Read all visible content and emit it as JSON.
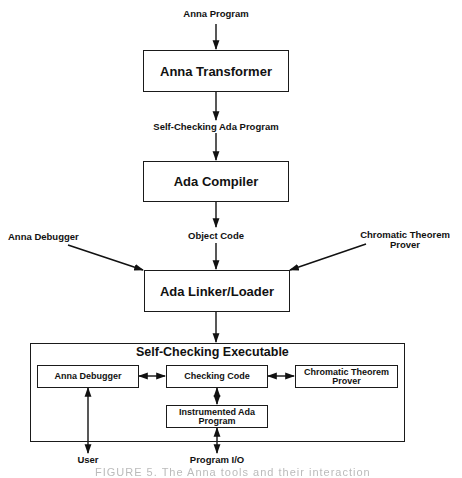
{
  "diagram": {
    "inputs": {
      "anna_program": "Anna Program",
      "self_checking_ada_program": "Self-Checking Ada Program",
      "object_code": "Object Code",
      "anna_debugger": "Anna Debugger",
      "chromatic_theorem_prover": [
        "Chromatic Theorem",
        "Prover"
      ]
    },
    "boxes": {
      "anna_transformer": "Anna Transformer",
      "ada_compiler": "Ada Compiler",
      "ada_linker_loader": "Ada Linker/Loader"
    },
    "executable": {
      "title": "Self-Checking Executable",
      "anna_debugger": "Anna Debugger",
      "checking_code": "Checking Code",
      "chromatic_theorem_prover": [
        "Chromatic Theorem",
        "Prover"
      ],
      "instrumented_ada_program": [
        "Instrumented Ada",
        "Program"
      ]
    },
    "outputs": {
      "user": "User",
      "program_io": "Program I/O"
    },
    "caption": "FIGURE 5.  The Anna tools and their interaction"
  }
}
